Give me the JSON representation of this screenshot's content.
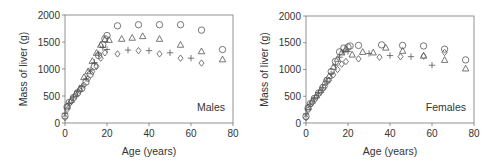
{
  "chart_data": [
    {
      "type": "scatter",
      "panel_label": "Males",
      "xlabel": "Age (years)",
      "ylabel": "Mass of liver (g)",
      "xlim": [
        0,
        80
      ],
      "ylim": [
        0,
        2000
      ],
      "xticks": [
        0,
        20,
        40,
        60,
        80
      ],
      "yticks": [
        0,
        500,
        1000,
        1500,
        2000
      ],
      "grid": false,
      "legend": "none",
      "series": [
        {
          "name": "circle",
          "marker": "circle",
          "x": [
            0,
            1,
            2,
            4,
            6,
            8,
            10,
            12,
            14,
            16,
            18,
            19,
            20,
            25,
            35,
            45,
            55,
            65,
            75
          ],
          "y": [
            130,
            300,
            380,
            470,
            560,
            640,
            760,
            900,
            1050,
            1250,
            1450,
            1560,
            1620,
            1800,
            1820,
            1820,
            1820,
            1720,
            1360
          ]
        },
        {
          "name": "triangle",
          "marker": "triangle",
          "x": [
            1,
            3,
            5,
            7,
            9,
            11,
            13,
            15,
            17,
            19,
            21,
            27,
            32,
            37,
            45,
            55,
            65,
            75
          ],
          "y": [
            320,
            430,
            540,
            640,
            850,
            960,
            1150,
            1300,
            1450,
            1550,
            1540,
            1560,
            1580,
            1610,
            1560,
            1450,
            1330,
            1180
          ]
        },
        {
          "name": "plus",
          "marker": "plus",
          "x": [
            0,
            2,
            4,
            6,
            8,
            10,
            12,
            14,
            16,
            18,
            20,
            30,
            40,
            50,
            60
          ],
          "y": [
            180,
            360,
            480,
            580,
            680,
            820,
            980,
            1120,
            1280,
            1400,
            1360,
            1350,
            1340,
            1300,
            1200
          ]
        },
        {
          "name": "diamond",
          "marker": "diamond",
          "x": [
            0,
            1,
            3,
            5,
            7,
            9,
            11,
            13,
            15,
            17,
            19,
            25,
            35,
            45,
            55,
            65
          ],
          "y": [
            100,
            250,
            400,
            500,
            600,
            700,
            820,
            950,
            1050,
            1200,
            1300,
            1280,
            1340,
            1280,
            1200,
            1110
          ]
        }
      ]
    },
    {
      "type": "scatter",
      "panel_label": "Females",
      "xlabel": "Age (years)",
      "ylabel": "Mass of liver (g)",
      "xlim": [
        0,
        80
      ],
      "ylim": [
        0,
        2000
      ],
      "xticks": [
        0,
        20,
        40,
        60,
        80
      ],
      "yticks": [
        0,
        500,
        1000,
        1500,
        2000
      ],
      "grid": false,
      "legend": "none",
      "series": [
        {
          "name": "circle",
          "marker": "circle",
          "x": [
            0,
            1,
            2,
            4,
            6,
            8,
            10,
            12,
            14,
            16,
            18,
            20,
            21,
            25,
            36,
            46,
            56,
            66,
            76
          ],
          "y": [
            120,
            280,
            360,
            460,
            560,
            660,
            800,
            960,
            1150,
            1330,
            1400,
            1420,
            1440,
            1450,
            1460,
            1450,
            1440,
            1380,
            1180
          ]
        },
        {
          "name": "triangle",
          "marker": "triangle",
          "x": [
            1,
            3,
            5,
            7,
            9,
            11,
            13,
            15,
            17,
            19,
            22,
            27,
            32,
            38,
            46,
            56,
            66,
            76
          ],
          "y": [
            300,
            420,
            520,
            620,
            760,
            880,
            1050,
            1200,
            1320,
            1380,
            1280,
            1330,
            1320,
            1410,
            1350,
            1260,
            1180,
            1020
          ]
        },
        {
          "name": "plus",
          "marker": "plus",
          "x": [
            0,
            2,
            4,
            6,
            8,
            10,
            12,
            14,
            16,
            18,
            20,
            30,
            40,
            50,
            60
          ],
          "y": [
            170,
            350,
            460,
            560,
            660,
            780,
            920,
            1080,
            1230,
            1330,
            1340,
            1300,
            1260,
            1240,
            1080
          ]
        },
        {
          "name": "diamond",
          "marker": "diamond",
          "x": [
            0,
            1,
            3,
            5,
            7,
            9,
            11,
            13,
            15,
            17,
            19,
            25,
            35,
            45,
            56,
            66
          ],
          "y": [
            100,
            240,
            380,
            480,
            580,
            680,
            800,
            900,
            1000,
            1100,
            1150,
            1200,
            1230,
            1240,
            1250,
            1320
          ]
        }
      ]
    }
  ]
}
